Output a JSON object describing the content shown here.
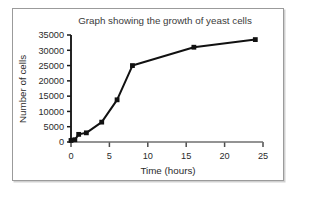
{
  "figure": {
    "border_color": "#9b9b9b",
    "background": "#ffffff"
  },
  "chart_data": {
    "type": "line",
    "title": "Graph showing the growth of yeast cells",
    "xlabel": "Time (hours)",
    "ylabel": "Number of cells",
    "xlim": [
      0,
      25
    ],
    "ylim": [
      0,
      35000
    ],
    "grid": false,
    "legend": null,
    "marker": "square",
    "line_color": "#111111",
    "x": [
      0,
      0.5,
      1,
      2,
      4,
      6,
      8,
      16,
      24
    ],
    "values": [
      500,
      750,
      2500,
      3000,
      6500,
      13800,
      25000,
      31000,
      33500
    ],
    "xticks": [
      0,
      5,
      10,
      15,
      20,
      25
    ],
    "xtick_labels": [
      "0",
      "5",
      "10",
      "15",
      "20",
      "25"
    ],
    "yticks": [
      0,
      5000,
      10000,
      15000,
      20000,
      25000,
      30000,
      35000
    ],
    "ytick_labels": [
      "0",
      "5000",
      "10000",
      "15000",
      "20000",
      "25000",
      "30000",
      "35000"
    ]
  }
}
